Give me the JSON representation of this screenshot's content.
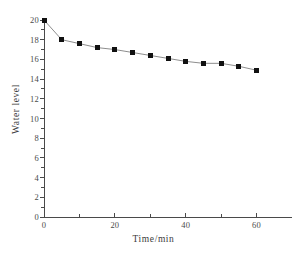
{
  "chart_data": {
    "type": "line",
    "title": "",
    "xlabel": "Time/min",
    "ylabel": "Water level",
    "xlim": [
      0,
      70
    ],
    "ylim": [
      0,
      20
    ],
    "grid": false,
    "legend": null,
    "marker": "filled-square",
    "marker_color": "#111111",
    "line_color": "#808080",
    "x": [
      0,
      5,
      10,
      15,
      20,
      25,
      30,
      35,
      40,
      45,
      50,
      55,
      60
    ],
    "values": [
      20.0,
      18.0,
      17.6,
      17.2,
      17.0,
      16.7,
      16.4,
      16.1,
      15.8,
      15.6,
      15.6,
      15.3,
      14.9
    ],
    "series": [
      {
        "name": "Water level",
        "x": [
          0,
          5,
          10,
          15,
          20,
          25,
          30,
          35,
          40,
          45,
          50,
          55,
          60
        ],
        "values": [
          20.0,
          18.0,
          17.6,
          17.2,
          17.0,
          16.7,
          16.4,
          16.1,
          15.8,
          15.6,
          15.6,
          15.3,
          14.9
        ]
      }
    ],
    "x_ticks_major": [
      0,
      20,
      40,
      60
    ],
    "x_ticks_major_labels": [
      "0",
      "20",
      "40",
      "60"
    ],
    "x_ticks_minor": [
      10,
      30,
      50
    ],
    "y_ticks_major": [
      0,
      2,
      4,
      6,
      8,
      10,
      12,
      14,
      16,
      18,
      20
    ],
    "y_ticks_major_labels": [
      "0",
      "2",
      "4",
      "6",
      "8",
      "10",
      "12",
      "14",
      "16",
      "18",
      "20"
    ],
    "y_ticks_minor": [
      1,
      3,
      5,
      7,
      9,
      11,
      13,
      15,
      17,
      19
    ]
  },
  "colors": {
    "axis": "#4a4a4a",
    "text": "#3b3b3b",
    "marker": "#111111",
    "line": "#808080",
    "background": "#ffffff"
  }
}
